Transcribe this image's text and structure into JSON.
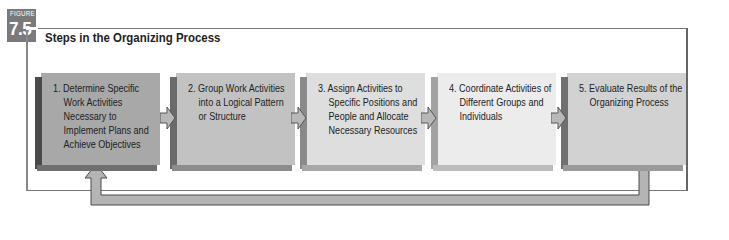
{
  "figure": {
    "tag_label": "FIGURE",
    "number": "7.5",
    "title": "Steps in the Organizing Process"
  },
  "steps": [
    {
      "label": "1. Determine Specific Work Activities Necessary to Implement Plans and Achieve Objectives",
      "fill": "#a8a8a8",
      "side": "#4a4a4a",
      "bottom": "#6f6f6f"
    },
    {
      "label": "2. Group Work Activities into a Logical Pattern or Structure",
      "fill": "#c2c2c2",
      "side": "#6a6a6a",
      "bottom": "#8c8c8c"
    },
    {
      "label": "3. Assign Activities to Specific Positions and People and Allocate Necessary Resources",
      "fill": "#dedede",
      "side": "#8a8a8a",
      "bottom": "#a8a8a8"
    },
    {
      "label": "4. Coordinate Activities of Different Groups and Individuals",
      "fill": "#ececec",
      "side": "#a2a2a2",
      "bottom": "#bcbcbc"
    },
    {
      "label": "5. Evaluate Results of the Organizing Process",
      "fill": "#d2d2d2",
      "side": "#707070",
      "bottom": "#9a9a9a"
    }
  ],
  "connectors": {
    "arrow_fill": "#b8b8b8",
    "arrow_stroke": "#555555",
    "feedback_fill": "#b0b0b0"
  }
}
